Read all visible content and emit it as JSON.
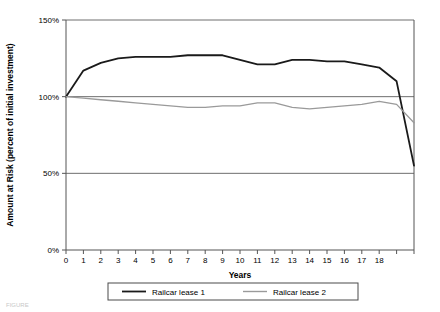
{
  "chart_data": {
    "type": "line",
    "title": "",
    "xlabel": "Years",
    "ylabel": "Amount at Risk (percent of initial investment)",
    "x": [
      0,
      1,
      2,
      3,
      4,
      5,
      6,
      7,
      8,
      9,
      10,
      11,
      12,
      13,
      14,
      15,
      16,
      17,
      18,
      19,
      20
    ],
    "xlim": [
      0,
      20
    ],
    "ylim": [
      0,
      150
    ],
    "xticks": [
      0,
      1,
      2,
      3,
      4,
      5,
      6,
      7,
      8,
      9,
      10,
      11,
      12,
      13,
      14,
      15,
      16,
      17,
      18,
      19,
      20
    ],
    "xtick_labels": [
      "0",
      "1",
      "2",
      "3",
      "4",
      "5",
      "6",
      "7",
      "8",
      "9",
      "10",
      "11",
      "12",
      "13",
      "14",
      "15",
      "16",
      "17",
      "18",
      "",
      ""
    ],
    "yticks": [
      0,
      50,
      100,
      150
    ],
    "ytick_labels": [
      "0%",
      "50%",
      "100%",
      "150%"
    ],
    "grid": true,
    "gridlines_y": [
      50,
      100,
      150
    ],
    "legend_position": "bottom",
    "series": [
      {
        "name": "Railcar lease 1",
        "color": "#1a1a1a",
        "width": 1.8,
        "values": [
          100,
          117,
          122,
          125,
          126,
          126,
          126,
          127,
          127,
          127,
          124,
          121,
          121,
          124,
          124,
          123,
          123,
          121,
          119,
          110,
          55
        ]
      },
      {
        "name": "Railcar lease 2",
        "color": "#9a9a9a",
        "width": 1.3,
        "values": [
          100,
          99,
          98,
          97,
          96,
          95,
          94,
          93,
          93,
          94,
          94,
          96,
          96,
          93,
          92,
          93,
          94,
          95,
          97,
          95,
          83
        ]
      }
    ]
  },
  "axis": {
    "ylabel": "Amount at Risk (percent of initial investment)",
    "xlabel": "Years"
  },
  "legend": {
    "entries": [
      {
        "label": "Railcar lease 1",
        "color": "#1a1a1a"
      },
      {
        "label": "Railcar lease 2",
        "color": "#9a9a9a"
      }
    ]
  },
  "caption": {
    "text": "FIGURE"
  },
  "colors": {
    "series1": "#1a1a1a",
    "series2": "#9a9a9a",
    "axis": "#555555",
    "grid": "#6e6e6e",
    "background": "#ffffff"
  }
}
